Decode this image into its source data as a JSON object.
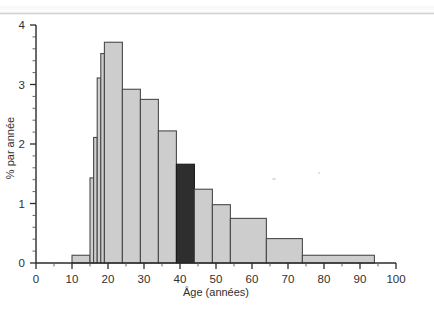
{
  "figure": {
    "name": "age-distribution-histogram",
    "background_color": "#ffffff"
  },
  "axes": {
    "x": {
      "title": "Âge (années)",
      "min": 0,
      "max": 100,
      "major_step": 10,
      "minor_step": 5,
      "tick_labels": [
        "0",
        "10",
        "20",
        "30",
        "40",
        "50",
        "60",
        "70",
        "80",
        "90",
        "100"
      ]
    },
    "y": {
      "title": "% par année",
      "min": 0,
      "max": 4,
      "major_step": 1,
      "minor_step": 0.2,
      "tick_labels": [
        "0",
        "1",
        "2",
        "3",
        "4"
      ]
    }
  },
  "colors": {
    "bar_light": "#cdcdcd",
    "bar_dark": "#2e2e2e",
    "bar_edge": "#4a4a4a",
    "axis": "#2b2b2b",
    "text": "#2f2f2f"
  },
  "chart_data": {
    "type": "bar",
    "title": "",
    "subtitle": "",
    "xlabel": "Âge (années)",
    "ylabel": "% par année",
    "xlim": [
      0,
      100
    ],
    "ylim": [
      0,
      4
    ],
    "grid": false,
    "legend": null,
    "bin_edges": [
      10,
      15,
      16,
      17,
      18,
      19,
      24,
      29,
      34,
      39,
      44,
      49,
      54,
      64,
      74,
      94
    ],
    "categories": [
      "10-15",
      "15-16",
      "16-17",
      "17-18",
      "18-19",
      "19-24",
      "24-29",
      "29-34",
      "34-39",
      "39-44",
      "44-49",
      "49-54",
      "54-64",
      "64-74",
      "74-94"
    ],
    "values": [
      0.13,
      1.43,
      2.11,
      3.11,
      3.52,
      3.71,
      2.92,
      2.75,
      2.22,
      1.66,
      1.24,
      0.98,
      0.75,
      0.41,
      0.13
    ],
    "bars": [
      {
        "label": "10-15",
        "x0": 10,
        "x1": 15,
        "value": 0.13,
        "highlight": false
      },
      {
        "label": "15-16",
        "x0": 15,
        "x1": 16,
        "value": 1.43,
        "highlight": false
      },
      {
        "label": "16-17",
        "x0": 16,
        "x1": 17,
        "value": 2.11,
        "highlight": false
      },
      {
        "label": "17-18",
        "x0": 17,
        "x1": 18,
        "value": 3.11,
        "highlight": false
      },
      {
        "label": "18-19",
        "x0": 18,
        "x1": 19,
        "value": 3.52,
        "highlight": false
      },
      {
        "label": "19-24",
        "x0": 19,
        "x1": 24,
        "value": 3.71,
        "highlight": false
      },
      {
        "label": "24-29",
        "x0": 24,
        "x1": 29,
        "value": 2.92,
        "highlight": false
      },
      {
        "label": "29-34",
        "x0": 29,
        "x1": 34,
        "value": 2.75,
        "highlight": false
      },
      {
        "label": "34-39",
        "x0": 34,
        "x1": 39,
        "value": 2.22,
        "highlight": false
      },
      {
        "label": "39-44",
        "x0": 39,
        "x1": 44,
        "value": 1.66,
        "highlight": true
      },
      {
        "label": "44-49",
        "x0": 44,
        "x1": 49,
        "value": 1.24,
        "highlight": false
      },
      {
        "label": "49-54",
        "x0": 49,
        "x1": 54,
        "value": 0.98,
        "highlight": false
      },
      {
        "label": "54-64",
        "x0": 54,
        "x1": 64,
        "value": 0.75,
        "highlight": false
      },
      {
        "label": "64-74",
        "x0": 64,
        "x1": 74,
        "value": 0.41,
        "highlight": false
      },
      {
        "label": "74-94",
        "x0": 74,
        "x1": 94,
        "value": 0.13,
        "highlight": false
      }
    ],
    "highlighted_bin": "39-44"
  }
}
